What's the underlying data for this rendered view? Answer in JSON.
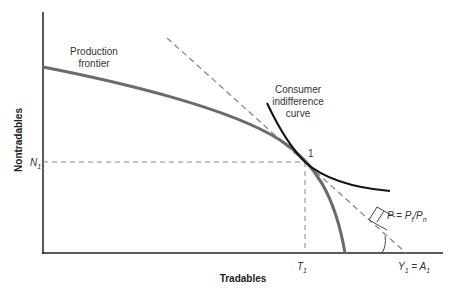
{
  "diagram": {
    "type": "economics-diagram",
    "axes": {
      "x_label": "Tradables",
      "y_label": "Nontradables"
    },
    "labels": {
      "production_frontier_line1": "Production",
      "production_frontier_line2": "frontier",
      "indifference_line1": "Consumer",
      "indifference_line2": "indifference",
      "indifference_line3": "curve",
      "point": "1",
      "n1_main": "N",
      "n1_sub": "1",
      "t1_main": "T",
      "t1_sub": "1",
      "y1_main": "Y",
      "y1_sub": "1",
      "y1_eq": " = A",
      "a1_sub": "1",
      "price_p": "P = P",
      "price_t_sub": "t",
      "price_slash": "/P",
      "price_n_sub": "n"
    },
    "colors": {
      "axis": "#222222",
      "frontier": "#6b6b6b",
      "indifference": "#111111",
      "budget_line": "#888888",
      "guide": "#888888"
    },
    "elements": [
      {
        "name": "production-frontier",
        "kind": "concave curve",
        "from": [
          43,
          67
        ],
        "through": [
          305,
          162
        ],
        "to": [
          345,
          253
        ]
      },
      {
        "name": "consumer-indifference-curve",
        "kind": "convex curve",
        "from": [
          267,
          103
        ],
        "through": [
          305,
          162
        ],
        "to": [
          390,
          191
        ]
      },
      {
        "name": "price-line",
        "kind": "dashed line",
        "from": [
          167,
          38
        ],
        "to": [
          406,
          253
        ]
      },
      {
        "name": "n1-guide",
        "kind": "dashed horizontal",
        "y": 162
      },
      {
        "name": "t1-guide",
        "kind": "dashed vertical",
        "x": 305
      }
    ]
  }
}
